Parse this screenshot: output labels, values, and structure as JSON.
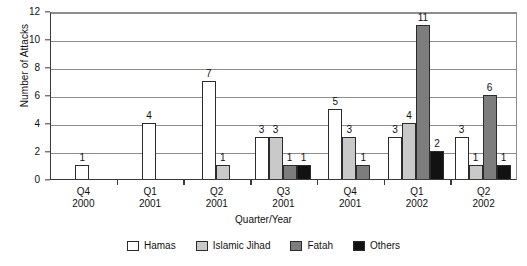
{
  "chart_data": {
    "type": "bar",
    "title": "",
    "xlabel": "Quarter/Year",
    "ylabel": "Number of Attacks",
    "ylim": [
      0,
      12
    ],
    "yticks": [
      0,
      2,
      4,
      6,
      8,
      10,
      12
    ],
    "grid": true,
    "legend_position": "bottom",
    "categories": [
      "Q4 2000",
      "Q1 2001",
      "Q2 2001",
      "Q3 2001",
      "Q4 2001",
      "Q1 2002",
      "Q2 2002"
    ],
    "category_lines": [
      {
        "quarter": "Q4",
        "year": "2000"
      },
      {
        "quarter": "Q1",
        "year": "2001"
      },
      {
        "quarter": "Q2",
        "year": "2001"
      },
      {
        "quarter": "Q3",
        "year": "2001"
      },
      {
        "quarter": "Q4",
        "year": "2001"
      },
      {
        "quarter": "Q1",
        "year": "2002"
      },
      {
        "quarter": "Q2",
        "year": "2002"
      }
    ],
    "series": [
      {
        "name": "Hamas",
        "color": "#ffffff",
        "values": [
          1,
          4,
          7,
          3,
          5,
          3,
          3
        ]
      },
      {
        "name": "Islamic Jihad",
        "color": "#c9c9c9",
        "values": [
          0,
          0,
          1,
          3,
          3,
          4,
          1
        ]
      },
      {
        "name": "Fatah",
        "color": "#7d7d7d",
        "values": [
          0,
          0,
          0,
          1,
          1,
          11,
          6
        ]
      },
      {
        "name": "Others",
        "color": "#121212",
        "values": [
          0,
          0,
          0,
          1,
          0,
          2,
          1
        ]
      }
    ]
  },
  "legend": {
    "items": [
      {
        "label": "Hamas",
        "color": "#ffffff"
      },
      {
        "label": "Islamic Jihad",
        "color": "#c9c9c9"
      },
      {
        "label": "Fatah",
        "color": "#7d7d7d"
      },
      {
        "label": "Others",
        "color": "#121212"
      }
    ]
  }
}
